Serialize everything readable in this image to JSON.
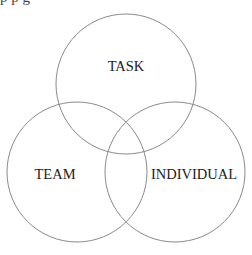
{
  "diagram": {
    "type": "venn",
    "stroke_color": "#8a8a8a",
    "text_color": "#222222",
    "background": "#ffffff",
    "cut_off_caption": "p         p                  g",
    "circles": [
      {
        "id": "task",
        "label": "TASK",
        "cx": 126,
        "cy": 84,
        "r": 70,
        "label_x": 126,
        "label_y": 71
      },
      {
        "id": "team",
        "label": "TEAM",
        "cx": 77,
        "cy": 172,
        "r": 70,
        "label_x": 55,
        "label_y": 179
      },
      {
        "id": "individual",
        "label": "INDIVIDUAL",
        "cx": 175,
        "cy": 172,
        "r": 70,
        "label_x": 194,
        "label_y": 179
      }
    ]
  }
}
